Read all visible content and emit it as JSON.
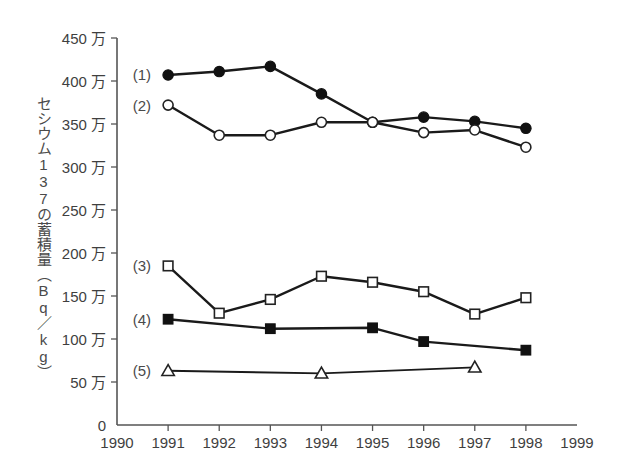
{
  "chart_data": {
    "type": "line",
    "title": "",
    "xlabel": "",
    "ylabel": "セシウム137の蓄積量（Bq／kg）",
    "x": [
      1991,
      1992,
      1993,
      1994,
      1995,
      1996,
      1997,
      1998
    ],
    "xlim": [
      1990,
      1999
    ],
    "ylim": [
      0,
      450
    ],
    "y_unit": "万",
    "grid": false,
    "legend_position": "inline-left",
    "x_tick_labels": [
      "1990",
      "1991",
      "1992",
      "1993",
      "1994",
      "1995",
      "1996",
      "1997",
      "1998",
      "1999"
    ],
    "y_tick_labels": [
      "0",
      "50 万",
      "100 万",
      "150 万",
      "200 万",
      "250 万",
      "300 万",
      "350 万",
      "400 万",
      "450 万"
    ],
    "y_tick_values": [
      0,
      50,
      100,
      150,
      200,
      250,
      300,
      350,
      400,
      450
    ],
    "series": [
      {
        "name": "(1)",
        "marker": "filled-circle",
        "x": [
          1991,
          1992,
          1993,
          1994,
          1995,
          1996,
          1997,
          1998
        ],
        "values": [
          407,
          411,
          417,
          385,
          352,
          358,
          353,
          345
        ]
      },
      {
        "name": "(2)",
        "marker": "open-circle",
        "x": [
          1991,
          1992,
          1993,
          1994,
          1995,
          1996,
          1997,
          1998
        ],
        "values": [
          372,
          337,
          337,
          352,
          352,
          340,
          343,
          323
        ]
      },
      {
        "name": "(3)",
        "marker": "open-square",
        "x": [
          1991,
          1992,
          1993,
          1994,
          1995,
          1996,
          1997,
          1998
        ],
        "values": [
          185,
          130,
          146,
          173,
          166,
          155,
          129,
          148
        ]
      },
      {
        "name": "(4)",
        "marker": "filled-square",
        "x": [
          1991,
          1993,
          1995,
          1996,
          1998
        ],
        "values": [
          123,
          112,
          113,
          97,
          87
        ]
      },
      {
        "name": "(5)",
        "marker": "open-triangle",
        "x": [
          1991,
          1994,
          1997
        ],
        "values": [
          63,
          60,
          67
        ]
      }
    ],
    "legend_labels": [
      "(1)",
      "(2)",
      "(3)",
      "(4)",
      "(5)"
    ]
  },
  "caption": ""
}
